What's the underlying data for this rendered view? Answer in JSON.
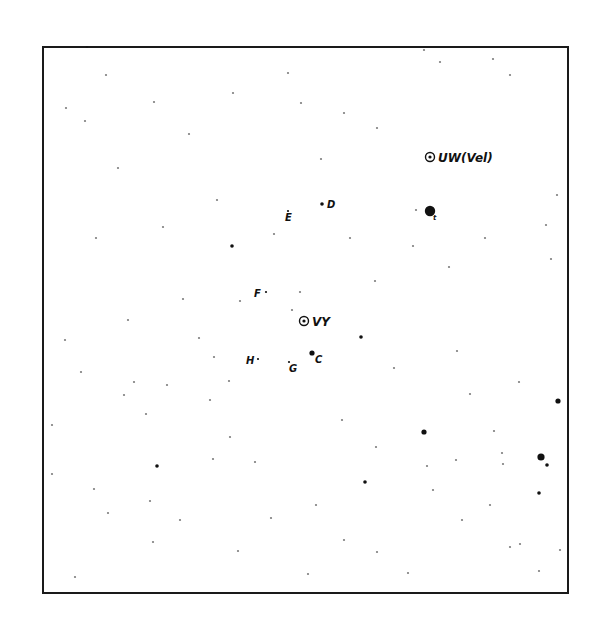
{
  "chart": {
    "type": "star-finder-chart",
    "ink_color": "#111111",
    "background_color": "#ffffff",
    "variables": [
      {
        "id": "UW",
        "label": "UW(Vel)",
        "x": 430,
        "y": 157
      },
      {
        "id": "VY",
        "label": "VY",
        "x": 304,
        "y": 321
      }
    ],
    "comparison_stars": [
      {
        "label": "D",
        "x": 322,
        "y": 204,
        "mag_class": 2
      },
      {
        "label": "E",
        "x": 288,
        "y": 211,
        "mag_class": 1
      },
      {
        "label": "F",
        "x": 266,
        "y": 292,
        "mag_class": 1
      },
      {
        "label": "C",
        "x": 312,
        "y": 353,
        "mag_class": 3
      },
      {
        "label": "G",
        "x": 289,
        "y": 362,
        "mag_class": 1
      },
      {
        "label": "H",
        "x": 258,
        "y": 359,
        "mag_class": 1
      },
      {
        "label": "t",
        "x": 430,
        "y": 211,
        "mag_class": 5
      }
    ],
    "field_stars": [
      [
        424,
        50,
        1
      ],
      [
        493,
        59,
        1
      ],
      [
        344,
        113,
        1
      ],
      [
        96,
        238,
        1
      ],
      [
        232,
        246,
        2
      ],
      [
        485,
        238,
        1
      ],
      [
        551,
        259,
        1
      ],
      [
        361,
        337,
        2
      ],
      [
        558,
        401,
        3
      ],
      [
        424,
        432,
        3
      ],
      [
        376,
        447,
        1
      ],
      [
        456,
        460,
        1
      ],
      [
        541,
        457,
        4
      ],
      [
        547,
        465,
        2
      ],
      [
        539,
        493,
        2
      ],
      [
        365,
        482,
        2
      ],
      [
        157,
        466,
        2
      ],
      [
        213,
        459,
        1
      ],
      [
        230,
        437,
        1
      ],
      [
        503,
        464,
        1
      ],
      [
        510,
        547,
        1
      ],
      [
        520,
        544,
        1
      ],
      [
        316,
        505,
        1
      ],
      [
        271,
        518,
        1
      ],
      [
        75,
        577,
        1
      ],
      [
        153,
        542,
        1
      ],
      [
        150,
        501,
        1
      ],
      [
        94,
        489,
        1
      ],
      [
        416,
        210,
        1
      ],
      [
        87,
        47,
        1
      ],
      [
        106,
        75,
        1
      ],
      [
        154,
        102,
        1
      ],
      [
        189,
        134,
        1
      ],
      [
        217,
        200,
        1
      ],
      [
        163,
        227,
        1
      ],
      [
        233,
        93,
        1
      ],
      [
        288,
        73,
        1
      ],
      [
        301,
        103,
        1
      ],
      [
        321,
        159,
        1
      ],
      [
        377,
        128,
        1
      ],
      [
        449,
        267,
        1
      ],
      [
        457,
        351,
        1
      ],
      [
        470,
        394,
        1
      ],
      [
        494,
        431,
        1
      ],
      [
        502,
        453,
        1
      ],
      [
        519,
        382,
        1
      ],
      [
        427,
        466,
        1
      ],
      [
        433,
        490,
        1
      ],
      [
        210,
        400,
        1
      ],
      [
        146,
        414,
        1
      ],
      [
        134,
        382,
        1
      ],
      [
        167,
        385,
        1
      ],
      [
        124,
        395,
        1
      ],
      [
        52,
        425,
        1
      ],
      [
        52,
        474,
        1
      ],
      [
        81,
        372,
        1
      ],
      [
        199,
        338,
        1
      ],
      [
        214,
        357,
        1
      ],
      [
        229,
        381,
        1
      ],
      [
        255,
        462,
        1
      ],
      [
        308,
        574,
        1
      ],
      [
        377,
        552,
        1
      ],
      [
        408,
        573,
        1
      ],
      [
        539,
        571,
        1
      ],
      [
        560,
        550,
        1
      ],
      [
        440,
        62,
        1
      ],
      [
        510,
        75,
        1
      ],
      [
        546,
        225,
        1
      ],
      [
        557,
        195,
        1
      ],
      [
        65,
        340,
        1
      ],
      [
        108,
        513,
        1
      ],
      [
        180,
        520,
        1
      ],
      [
        238,
        551,
        1
      ],
      [
        344,
        540,
        1
      ],
      [
        462,
        520,
        1
      ],
      [
        490,
        505,
        1
      ],
      [
        394,
        368,
        1
      ],
      [
        342,
        420,
        1
      ],
      [
        274,
        234,
        1
      ],
      [
        350,
        238,
        1
      ],
      [
        375,
        281,
        1
      ],
      [
        413,
        246,
        1
      ],
      [
        240,
        301,
        1
      ],
      [
        292,
        310,
        1
      ],
      [
        300,
        292,
        1
      ],
      [
        183,
        299,
        1
      ],
      [
        128,
        320,
        1
      ],
      [
        85,
        121,
        1
      ],
      [
        118,
        168,
        1
      ],
      [
        66,
        108,
        1
      ]
    ]
  }
}
